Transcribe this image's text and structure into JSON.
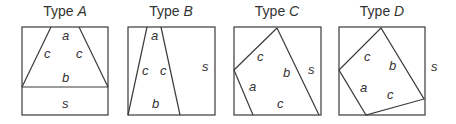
{
  "panels": [
    {
      "id": "A",
      "title_prefix": "Type ",
      "title_var": "A",
      "labels": {
        "a": "a",
        "c_left": "c",
        "c_right": "c",
        "b": "b",
        "s": "s"
      }
    },
    {
      "id": "B",
      "title_prefix": "Type ",
      "title_var": "B",
      "labels": {
        "a": "a",
        "c_left": "c",
        "c_right": "c",
        "b": "b",
        "s": "s"
      }
    },
    {
      "id": "C",
      "title_prefix": "Type ",
      "title_var": "C",
      "labels": {
        "c_top": "c",
        "b": "b",
        "a": "a",
        "c_bottom": "c",
        "s": "s"
      }
    },
    {
      "id": "D",
      "title_prefix": "Type ",
      "title_var": "D",
      "labels": {
        "c_top": "c",
        "b": "b",
        "a": "a",
        "c_bottom": "c",
        "s": "s"
      }
    }
  ],
  "colors": {
    "stroke": "#3a3a3a",
    "text": "#333333"
  }
}
